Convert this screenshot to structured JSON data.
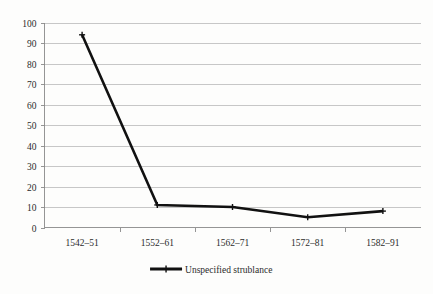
{
  "chart_data": {
    "type": "line",
    "title": "",
    "subtitle": "",
    "xlabel": "",
    "ylabel": "",
    "categories": [
      "1542–51",
      "1552–61",
      "1562–71",
      "1572–81",
      "1582–91"
    ],
    "series": [
      {
        "name": "Unspecified strublance",
        "values": [
          94,
          11,
          10,
          5,
          8
        ],
        "color": "#111111",
        "marker": "plus"
      }
    ],
    "ylim": [
      0,
      100
    ],
    "ytick_interval": 10,
    "ytick_labels": [
      "0",
      "10",
      "20",
      "30",
      "40",
      "50",
      "60",
      "70",
      "80",
      "90",
      "100"
    ],
    "grid": {
      "horizontal": true,
      "vertical": false,
      "color": "#b9b9b9"
    },
    "legend": {
      "position": "bottom",
      "entries": [
        "Unspecified strublance"
      ]
    },
    "axis": {
      "color": "#8a8a8a",
      "x_ticks_between_categories": true
    },
    "background": "#fdfdfc"
  }
}
